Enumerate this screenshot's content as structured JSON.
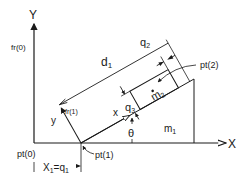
{
  "diagram": {
    "axes": {
      "y_label": "Y",
      "x_label": "X"
    },
    "labels": {
      "fr0": "fr(0)",
      "fr1": "fr(1)",
      "d1": "d",
      "d1_sub": "1",
      "q2": "q",
      "q2_sub": "2",
      "q3": "q",
      "q3_sub": "3",
      "m2": "m",
      "m2_sub": "2",
      "m1": "m",
      "m1_sub": "1",
      "pt2": "pt(2)",
      "pt1": "pt(1)",
      "pt0": "pt(0)",
      "theta": "θ",
      "x_local": "x",
      "y_local": "y",
      "x1_eq": "X",
      "x1_sub": "1",
      "x1_eq_rest": "=q",
      "x1_q_sub": "1"
    },
    "colors": {
      "ink": "#1a1a1a",
      "background": "#ffffff"
    }
  }
}
